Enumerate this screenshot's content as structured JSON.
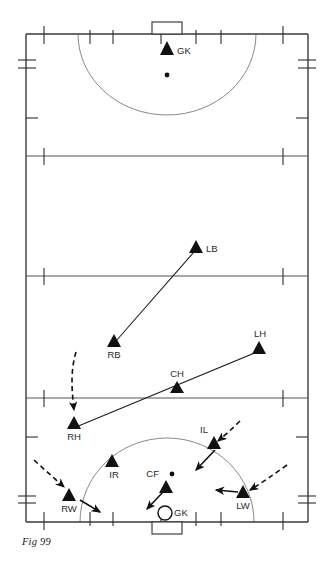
{
  "figure": {
    "caption": "Fig 99"
  },
  "pitch": {
    "boundary_color": "#3a3a3a",
    "line_color": "#555555",
    "arc_color": "#6a6a6a",
    "marker_color": "#111111",
    "left": 26,
    "right": 308,
    "top": 34,
    "bottom": 522,
    "horizontal_lines": [
      156,
      276,
      398
    ]
  },
  "goals": [
    {
      "name": "top-goal",
      "x": 167,
      "y": 34,
      "width": 30,
      "height": 12,
      "side": "top"
    },
    {
      "name": "bottom-goal",
      "x": 167,
      "y": 522,
      "width": 30,
      "height": 12,
      "side": "bottom"
    }
  ],
  "shooting_circles": [
    {
      "name": "top-d",
      "center_x": 167,
      "center_y": 34,
      "radius_x": 89,
      "radius_y": 81
    },
    {
      "name": "bottom-d",
      "center_x": 167,
      "center_y": 522,
      "radius_x": 87,
      "radius_y": 84
    }
  ],
  "spot_markers": [
    {
      "name": "top-penalty-spot",
      "x": 167,
      "y": 75
    },
    {
      "name": "bottom-ball-spot",
      "x": 171,
      "y": 474
    }
  ],
  "players": [
    {
      "label": "GK",
      "x": 167,
      "y": 50,
      "shape": "triangle",
      "label_dx": 9,
      "label_dy": 3,
      "label_anchor": "start"
    },
    {
      "label": "LB",
      "x": 196,
      "y": 248,
      "shape": "triangle",
      "label_dx": 9,
      "label_dy": 3,
      "label_anchor": "start"
    },
    {
      "label": "RB",
      "x": 114,
      "y": 342,
      "shape": "triangle",
      "label_dx": 0,
      "label_dy": 14,
      "label_anchor": "middle"
    },
    {
      "label": "LH",
      "x": 259,
      "y": 348,
      "shape": "triangle",
      "label_dx": 0,
      "label_dy": -11,
      "label_anchor": "middle"
    },
    {
      "label": "CH",
      "x": 177,
      "y": 388,
      "shape": "triangle",
      "label_dx": 0,
      "label_dy": -11,
      "label_anchor": "middle"
    },
    {
      "label": "RH",
      "x": 74,
      "y": 424,
      "shape": "triangle",
      "label_dx": 0,
      "label_dy": 14,
      "label_anchor": "middle"
    },
    {
      "label": "IL",
      "x": 214,
      "y": 443,
      "shape": "triangle",
      "label_dx": -4,
      "label_dy": -11,
      "label_anchor": "end"
    },
    {
      "label": "IR",
      "x": 112,
      "y": 461,
      "shape": "triangle",
      "label_dx": 1,
      "label_dy": 14,
      "label_anchor": "middle"
    },
    {
      "label": "CF",
      "x": 166,
      "y": 487,
      "shape": "triangle",
      "label_dx": -8,
      "label_dy": -9,
      "label_anchor": "end"
    },
    {
      "label": "RW",
      "x": 69,
      "y": 496,
      "shape": "triangle",
      "label_dx": 0,
      "label_dy": 14,
      "label_anchor": "middle"
    },
    {
      "label": "LW",
      "x": 243,
      "y": 493,
      "shape": "triangle",
      "label_dx": 0,
      "label_dy": 14,
      "label_anchor": "middle"
    },
    {
      "label": "GK",
      "x": 165,
      "y": 513,
      "shape": "circle",
      "label_dx": 9,
      "label_dy": 3,
      "label_anchor": "start"
    }
  ],
  "solid_lines": [
    {
      "name": "lb-to-rb-line",
      "x1": 194,
      "y1": 252,
      "x2": 116,
      "y2": 341
    },
    {
      "name": "lh-to-rh-line",
      "x1": 257,
      "y1": 352,
      "x2": 76,
      "y2": 427
    }
  ],
  "dashed_arrows": [
    {
      "name": "rh-run-arrow",
      "path": "M 75 354 C 70 370, 72 390, 74 408",
      "tip_x": 74,
      "tip_y": 414,
      "angle": 92
    },
    {
      "name": "rw-run-arrow",
      "path": "M 35 461 C 46 470, 56 480, 65 488",
      "tip_x": 68,
      "tip_y": 491,
      "angle": 42
    },
    {
      "name": "il-run-arrow",
      "path": "M 238 423 C 231 430, 224 436, 218 441",
      "tip_x": 215,
      "tip_y": 444,
      "angle": 222
    },
    {
      "name": "lw-run-arrow",
      "path": "M 285 467 C 272 476, 260 484, 250 490",
      "tip_x": 247,
      "tip_y": 492,
      "angle": 210
    }
  ],
  "solid_arrows": [
    {
      "name": "il-pass-arrow",
      "x1": 212,
      "y1": 449,
      "x2": 194,
      "y2": 469,
      "angle": 132
    },
    {
      "name": "rw-pass-arrow",
      "x1": 81,
      "y1": 500,
      "x2": 101,
      "y2": 512,
      "angle": 31
    },
    {
      "name": "cf-pass-arrow",
      "x1": 162,
      "y1": 492,
      "x2": 146,
      "y2": 509,
      "angle": 133
    },
    {
      "name": "lw-pass-arrow",
      "x1": 237,
      "y1": 493,
      "x2": 214,
      "y2": 491,
      "angle": 185
    }
  ],
  "side_marks": {
    "top_ticks_x": [
      44,
      90,
      113,
      161,
      196,
      221,
      283
    ],
    "bottom_ticks_x": [
      44,
      90,
      113,
      161,
      196,
      221,
      283
    ],
    "left_ticks_y": [
      60,
      118,
      159,
      279,
      401,
      437,
      500
    ],
    "right_ticks_y": [
      60,
      118,
      159,
      279,
      401,
      437,
      500
    ],
    "line_ticks_x": [
      44,
      283
    ]
  }
}
